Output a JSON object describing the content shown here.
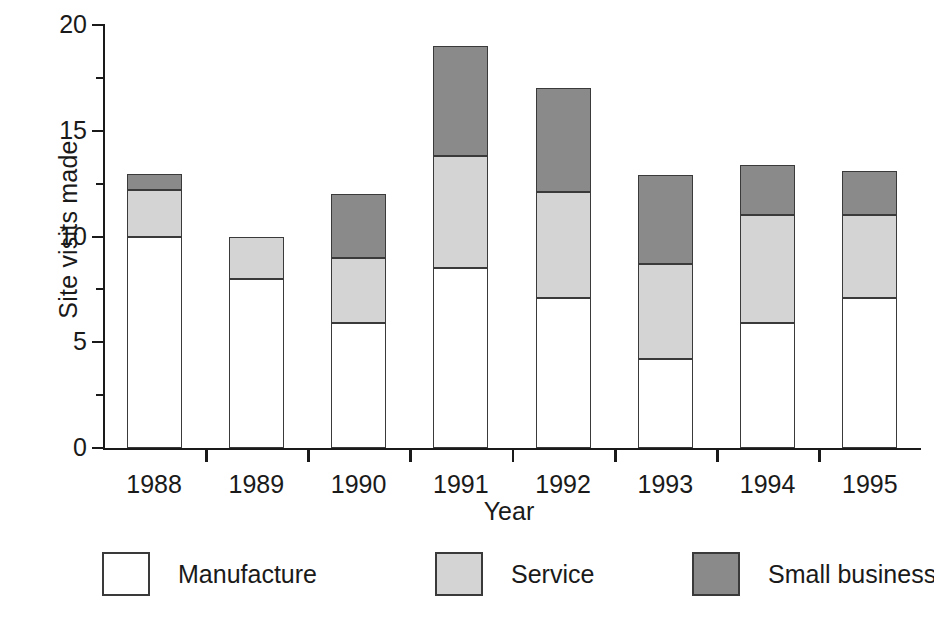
{
  "chart_data": {
    "type": "bar",
    "stacked": true,
    "title": "",
    "xlabel": "Year",
    "ylabel": "Site visits made",
    "categories": [
      "1988",
      "1989",
      "1990",
      "1991",
      "1992",
      "1993",
      "1994",
      "1995"
    ],
    "series": [
      {
        "name": "Manufacture",
        "color": "#ffffff",
        "values": [
          10.0,
          8.0,
          5.9,
          8.5,
          7.1,
          4.2,
          5.9,
          7.1
        ]
      },
      {
        "name": "Service",
        "color": "#d4d4d4",
        "values": [
          2.2,
          2.0,
          3.1,
          5.3,
          5.0,
          4.5,
          5.1,
          3.9
        ]
      },
      {
        "name": "Small business",
        "color": "#8a8a8a",
        "values": [
          0.75,
          0.0,
          3.0,
          5.2,
          4.9,
          4.2,
          2.4,
          2.1
        ]
      }
    ],
    "totals": [
      12.95,
      10.0,
      12.0,
      19.0,
      17.0,
      12.9,
      13.4,
      13.1
    ],
    "ylim": [
      0,
      20
    ],
    "ytick_major": [
      "0",
      "5",
      "10",
      "15",
      "20"
    ],
    "ytick_major_values": [
      0,
      5,
      10,
      15,
      20
    ],
    "ytick_minor_values": [
      2.5,
      7.5,
      12.5,
      17.5
    ],
    "grid": false,
    "legend_position": "bottom"
  },
  "axes": {
    "ylabel": "Site visits made",
    "xlabel": "Year"
  },
  "legend": {
    "items": [
      {
        "label": "Manufacture",
        "swatch": "manufacture"
      },
      {
        "label": "Service",
        "swatch": "service"
      },
      {
        "label": "Small business",
        "swatch": "smallbiz"
      }
    ]
  },
  "colors": {
    "manufacture": "#ffffff",
    "service": "#d4d4d4",
    "small_business": "#8a8a8a",
    "axis": "#1a1a1a",
    "outline": "#3a3a3a",
    "background": "#ffffff"
  }
}
